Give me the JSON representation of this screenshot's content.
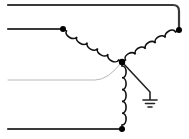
{
  "diagram": {
    "colors": {
      "wire": "#3a3a3a",
      "wire_light": "#b8b8b8",
      "coil": "#111111",
      "node": "#000000",
      "ground": "#222222",
      "background": "#ffffff"
    },
    "nodes": [
      {
        "id": "phase-a-terminal",
        "label": "Phase A terminal"
      },
      {
        "id": "phase-b-terminal",
        "label": "Phase B terminal"
      },
      {
        "id": "phase-c-terminal",
        "label": "Phase C terminal"
      },
      {
        "id": "neutral-point",
        "label": "Neutral point"
      }
    ],
    "windings": [
      {
        "id": "winding-a",
        "from": "phase-a-terminal",
        "to": "neutral-point",
        "turns": 5
      },
      {
        "id": "winding-b",
        "from": "phase-b-terminal",
        "to": "neutral-point",
        "turns": 5
      },
      {
        "id": "winding-c",
        "from": "phase-c-terminal",
        "to": "neutral-point",
        "turns": 5
      }
    ],
    "leads": [
      {
        "id": "lead-1",
        "connects": "phase-b-terminal",
        "style": "dark"
      },
      {
        "id": "lead-2",
        "connects": "phase-a-terminal",
        "style": "dark"
      },
      {
        "id": "lead-3",
        "connects": "neutral-point",
        "style": "light"
      },
      {
        "id": "lead-4",
        "connects": "phase-c-terminal",
        "style": "dark"
      }
    ],
    "ground": {
      "label": "Ground",
      "connects": "neutral-point"
    }
  }
}
